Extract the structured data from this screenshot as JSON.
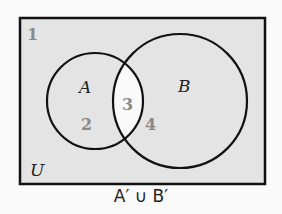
{
  "diagram": {
    "type": "venn",
    "universe_label": "U",
    "sets": [
      {
        "name": "A",
        "label": "A"
      },
      {
        "name": "B",
        "label": "B"
      }
    ],
    "regions": [
      {
        "id": "1",
        "label": "1",
        "description": "outside A and B",
        "shaded": true
      },
      {
        "id": "2",
        "label": "2",
        "description": "A only",
        "shaded": true
      },
      {
        "id": "3",
        "label": "3",
        "description": "A and B",
        "shaded": false
      },
      {
        "id": "4",
        "label": "4",
        "description": "B only",
        "shaded": true
      }
    ],
    "caption": "A′ ∪ B′",
    "colors": {
      "shaded": "#e4e4e4",
      "unshaded": "#fafafa",
      "stroke": "#111111",
      "region_number": "#8a8a8a"
    }
  }
}
